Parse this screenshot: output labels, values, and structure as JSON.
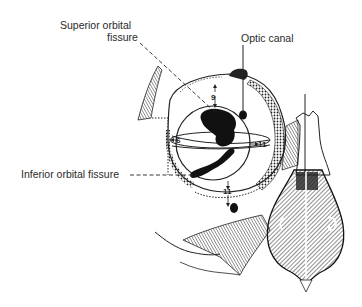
{
  "diagram": {
    "labels": {
      "superior_orbital_fissure_line1": "Superior orbital",
      "superior_orbital_fissure_line2": "fissure",
      "optic_canal": "Optic canal",
      "inferior_orbital_fissure": "Inferior orbital fissure"
    },
    "measurements": {
      "top": "9",
      "left": "6",
      "right": "11",
      "bottom": "11"
    },
    "colors": {
      "ink": "#1a1a1a",
      "text": "#2a2a2a",
      "background": "#ffffff"
    }
  }
}
